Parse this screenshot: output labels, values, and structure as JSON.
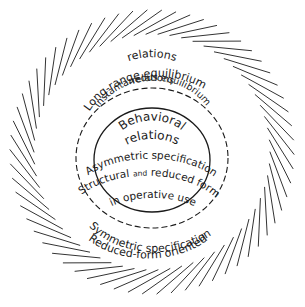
{
  "diagram": {
    "outer_ring": {
      "label_top_line1": "Long-range equilibrium",
      "label_top_line2": "relations",
      "label_bottom_line1": "Symmetric specification",
      "label_bottom_line2": "Reduced-form oriented",
      "tick_style": "pinwheel radial dashes"
    },
    "dashed_ring": {
      "label_top_line1": "Instantaneous equilibrium",
      "label_top_line2": "relations",
      "label_bottom_line1": "Symmetric specification",
      "label_bottom_line2": "Reduced-form oriented"
    },
    "inner_circle": {
      "label_top_line1": "Behavioral",
      "label_top_line2": "relations",
      "label_bottom_line1": "Asymmetric specification",
      "label_bottom_line2_a": "Structural ",
      "label_bottom_line2_b": "and",
      "label_bottom_line2_c": " reduced forms",
      "label_bottom_line3": "in operative use"
    },
    "colors": {
      "line": "#1a1a1a",
      "tick": "#333333",
      "background": "#ffffff"
    }
  }
}
